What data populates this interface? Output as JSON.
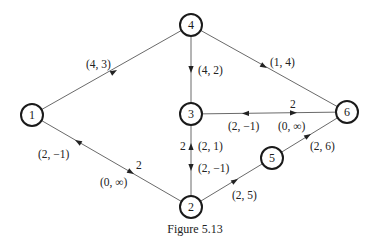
{
  "diagram": {
    "type": "network-graph",
    "caption": "Figure 5.13",
    "nodes": [
      {
        "id": "1",
        "label": "1",
        "x": 32,
        "y": 115
      },
      {
        "id": "2",
        "label": "2",
        "x": 191,
        "y": 207
      },
      {
        "id": "3",
        "label": "3",
        "x": 191,
        "y": 114
      },
      {
        "id": "4",
        "label": "4",
        "x": 191,
        "y": 25
      },
      {
        "id": "5",
        "label": "5",
        "x": 272,
        "y": 158
      },
      {
        "id": "6",
        "label": "6",
        "x": 347,
        "y": 112
      }
    ],
    "edges": [
      {
        "id": "e1-4",
        "from": "1",
        "to": "4",
        "labels": [
          {
            "text": "(4, 3)",
            "direction": "1->4"
          }
        ]
      },
      {
        "id": "e4-3",
        "from": "4",
        "to": "3",
        "labels": [
          {
            "text": "(4, 2)",
            "direction": "4->3"
          }
        ]
      },
      {
        "id": "e4-6",
        "from": "4",
        "to": "6",
        "labels": [
          {
            "text": "(1, 4)",
            "direction": "6->4"
          }
        ]
      },
      {
        "id": "e3-6",
        "from": "3",
        "to": "6",
        "labels": [
          {
            "text": "(2, −1)",
            "direction": "6->3"
          },
          {
            "text": "(0, ∞)",
            "direction": "3->6",
            "capacity": "2"
          }
        ]
      },
      {
        "id": "e3-2",
        "from": "3",
        "to": "2",
        "labels": [
          {
            "text": "(2, 1)",
            "direction": "2->3",
            "capacity": "2"
          },
          {
            "text": "(2, −1)",
            "direction": "3->2"
          }
        ]
      },
      {
        "id": "e1-2",
        "from": "1",
        "to": "2",
        "labels": [
          {
            "text": "(2, −1)",
            "direction": "2->1"
          },
          {
            "text": "(0, ∞)",
            "direction": "1->2",
            "capacity": "2"
          }
        ]
      },
      {
        "id": "e2-5",
        "from": "2",
        "to": "5",
        "labels": [
          {
            "text": "(2, 5)",
            "direction": "2->5"
          }
        ]
      },
      {
        "id": "e5-6",
        "from": "5",
        "to": "6",
        "labels": [
          {
            "text": "(2, 6)",
            "direction": "5->6"
          }
        ]
      }
    ]
  }
}
